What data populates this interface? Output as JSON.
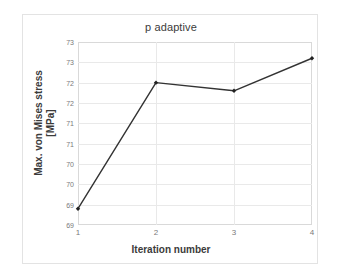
{
  "chart_data": {
    "type": "line",
    "title": "p adaptive",
    "xlabel": "Iteration number",
    "ylabel": "Max. von Mises stress\n[MPa]",
    "x": [
      1,
      2,
      3,
      4
    ],
    "values": [
      69.15,
      72.25,
      72.05,
      72.85
    ],
    "series": [
      {
        "name": "p adaptive",
        "values": [
          69.15,
          72.25,
          72.05,
          72.85
        ]
      }
    ],
    "xlim": [
      1,
      4
    ],
    "ylim": [
      68.75,
      73.25
    ],
    "xticks": [
      "1",
      "2",
      "3",
      "4"
    ],
    "xtick_values": [
      1,
      2,
      3,
      4
    ],
    "ytick_values": [
      68.75,
      69.25,
      69.75,
      70.25,
      70.75,
      71.25,
      71.75,
      72.25,
      72.75,
      73.25
    ],
    "yticks": [
      "69",
      "69",
      "70",
      "70",
      "71",
      "71",
      "72",
      "72",
      "73",
      "73"
    ],
    "grid": true,
    "grid_axis": "both",
    "legend": false,
    "legend_position": "none",
    "line_color": "#333333",
    "marker": "diamond",
    "marker_color": "#222222"
  },
  "style": {
    "background": "#ffffff",
    "card_border": "#e3e3e3",
    "plot_border": "#d9d9d9",
    "gridline_color": "#e9e9e9",
    "tick_label_color": "#7a7a7a",
    "title_color": "#3b3b3b"
  }
}
